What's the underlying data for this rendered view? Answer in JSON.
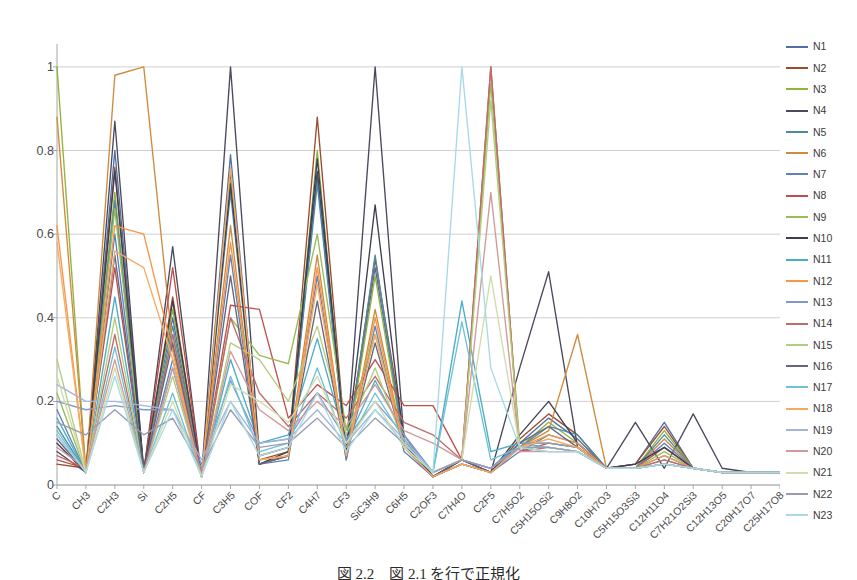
{
  "caption": "図 2.2　図 2.1 を行で正規化",
  "colors": {
    "gridline": "#d0d0d0",
    "axis": "#a6a6a6",
    "text": "#4a4a4a",
    "background": "#ffffff"
  },
  "legend": {
    "position": "right",
    "entries": [
      {
        "label": "N1",
        "color": "#4f6fa5"
      },
      {
        "label": "N2",
        "color": "#9c4d2f"
      },
      {
        "label": "N3",
        "color": "#93b23e"
      },
      {
        "label": "N4",
        "color": "#4a4a5e"
      },
      {
        "label": "N5",
        "color": "#4e89a8"
      },
      {
        "label": "N6",
        "color": "#d08a3e"
      },
      {
        "label": "N7",
        "color": "#5f81bd"
      },
      {
        "label": "N8",
        "color": "#c0504d"
      },
      {
        "label": "N9",
        "color": "#9bbb59"
      },
      {
        "label": "N10",
        "color": "#3f3f54"
      },
      {
        "label": "N11",
        "color": "#4bacc6"
      },
      {
        "label": "N12",
        "color": "#f79646"
      },
      {
        "label": "N13",
        "color": "#8098cf"
      },
      {
        "label": "N14",
        "color": "#bf6d6b"
      },
      {
        "label": "N15",
        "color": "#b5cc7e"
      },
      {
        "label": "N16",
        "color": "#666680"
      },
      {
        "label": "N17",
        "color": "#6fc2d5"
      },
      {
        "label": "N18",
        "color": "#f5ab63"
      },
      {
        "label": "N19",
        "color": "#a4b4dd"
      },
      {
        "label": "N20",
        "color": "#d19a98"
      },
      {
        "label": "N21",
        "color": "#cfdcab"
      },
      {
        "label": "N22",
        "color": "#9a9ab0"
      },
      {
        "label": "N23",
        "color": "#a8dae6"
      }
    ]
  },
  "chart_data": {
    "type": "line",
    "title": "",
    "xlabel": "",
    "ylabel": "",
    "ylim": [
      0,
      1.05
    ],
    "yticks": [
      0,
      0.2,
      0.4,
      0.6,
      0.8,
      1
    ],
    "ytick_labels": [
      "0",
      "0.2",
      "0.4",
      "0.6",
      "0.8",
      "1"
    ],
    "grid": true,
    "grid_axis": "y",
    "legend_position": "right",
    "categories": [
      "C",
      "CH3",
      "C2H3",
      "Si",
      "C2H5",
      "CF",
      "C3H5",
      "COF",
      "CF2",
      "C4H7",
      "CF3",
      "SiC3H9",
      "C6H5",
      "C2OF3",
      "C7H4O",
      "C2F5",
      "C7H5O2",
      "C5H15OSi2",
      "C9H8O2",
      "C10H7O3",
      "C5H15O3Si3",
      "C12H11O4",
      "C7H21O2Si3",
      "C12H13O5",
      "C20H17O7",
      "C25H17O8"
    ],
    "series": [
      {
        "name": "N1",
        "color": "#4f6fa5",
        "values": [
          0.12,
          0.03,
          0.8,
          0.04,
          0.4,
          0.02,
          0.79,
          0.05,
          0.07,
          0.74,
          0.07,
          0.52,
          0.1,
          0.02,
          0.06,
          0.04,
          0.1,
          0.16,
          0.11,
          0.04,
          0.05,
          0.15,
          0.04,
          0.03,
          0.03,
          0.03
        ]
      },
      {
        "name": "N2",
        "color": "#9c4d2f",
        "values": [
          0.05,
          0.04,
          0.76,
          0.03,
          0.45,
          0.02,
          0.75,
          0.06,
          0.08,
          0.88,
          0.08,
          0.54,
          0.12,
          0.02,
          0.05,
          0.03,
          0.11,
          0.17,
          0.12,
          0.04,
          0.05,
          0.14,
          0.04,
          0.03,
          0.03,
          0.03
        ]
      },
      {
        "name": "N3",
        "color": "#93b23e",
        "values": [
          1.0,
          0.03,
          0.7,
          0.03,
          0.42,
          0.02,
          0.73,
          0.05,
          0.07,
          0.8,
          0.07,
          0.5,
          0.09,
          0.02,
          0.05,
          0.03,
          0.09,
          0.15,
          0.1,
          0.04,
          0.04,
          0.13,
          0.04,
          0.03,
          0.03,
          0.03
        ]
      },
      {
        "name": "N4",
        "color": "#4a4a5e",
        "values": [
          0.08,
          0.03,
          0.87,
          0.03,
          0.57,
          0.02,
          1.0,
          0.07,
          0.09,
          0.75,
          0.08,
          1.0,
          0.11,
          0.02,
          0.06,
          0.03,
          0.28,
          0.51,
          0.09,
          0.04,
          0.15,
          0.04,
          0.17,
          0.04,
          0.03,
          0.03
        ]
      },
      {
        "name": "N5",
        "color": "#4e89a8",
        "values": [
          0.14,
          0.03,
          0.68,
          0.03,
          0.38,
          0.02,
          0.7,
          0.05,
          0.07,
          0.72,
          0.07,
          0.55,
          0.09,
          0.02,
          0.05,
          0.03,
          0.09,
          0.14,
          0.12,
          0.04,
          0.04,
          0.12,
          0.04,
          0.03,
          0.03,
          0.03
        ]
      },
      {
        "name": "N6",
        "color": "#d08a3e",
        "values": [
          0.88,
          0.03,
          0.98,
          1.0,
          0.33,
          0.02,
          0.62,
          0.05,
          0.07,
          0.55,
          0.06,
          0.42,
          0.09,
          0.02,
          0.05,
          0.03,
          0.09,
          0.13,
          0.36,
          0.04,
          0.04,
          0.11,
          0.04,
          0.03,
          0.03,
          0.03
        ]
      },
      {
        "name": "N7",
        "color": "#5f81bd",
        "values": [
          0.18,
          0.03,
          0.6,
          0.03,
          0.3,
          0.02,
          0.55,
          0.05,
          0.06,
          0.5,
          0.06,
          0.38,
          0.08,
          0.02,
          0.05,
          0.03,
          0.08,
          0.12,
          0.1,
          0.04,
          0.04,
          0.1,
          0.04,
          0.03,
          0.03,
          0.03
        ]
      },
      {
        "name": "N8",
        "color": "#c0504d",
        "values": [
          0.06,
          0.04,
          0.52,
          0.03,
          0.52,
          0.02,
          0.43,
          0.42,
          0.16,
          0.24,
          0.19,
          0.3,
          0.19,
          0.19,
          0.06,
          1.0,
          0.08,
          0.1,
          0.09,
          0.04,
          0.04,
          0.09,
          0.04,
          0.03,
          0.03,
          0.03
        ]
      },
      {
        "name": "N9",
        "color": "#9bbb59",
        "values": [
          0.22,
          0.03,
          0.66,
          0.03,
          0.36,
          0.02,
          0.4,
          0.31,
          0.29,
          0.6,
          0.13,
          0.36,
          0.1,
          0.03,
          0.06,
          0.96,
          0.1,
          0.1,
          0.09,
          0.04,
          0.04,
          0.08,
          0.04,
          0.03,
          0.03,
          0.03
        ]
      },
      {
        "name": "N10",
        "color": "#3f3f54",
        "values": [
          0.1,
          0.03,
          0.75,
          0.03,
          0.44,
          0.02,
          0.72,
          0.05,
          0.08,
          0.78,
          0.08,
          0.67,
          0.1,
          0.02,
          0.06,
          0.03,
          0.12,
          0.2,
          0.1,
          0.04,
          0.05,
          0.09,
          0.04,
          0.03,
          0.03,
          0.03
        ]
      },
      {
        "name": "N11",
        "color": "#4bacc6",
        "values": [
          0.16,
          0.03,
          0.45,
          0.03,
          0.28,
          0.02,
          0.3,
          0.1,
          0.12,
          0.35,
          0.1,
          0.25,
          0.12,
          0.03,
          0.44,
          0.08,
          0.1,
          0.09,
          0.08,
          0.04,
          0.04,
          0.07,
          0.04,
          0.03,
          0.03,
          0.03
        ]
      },
      {
        "name": "N12",
        "color": "#f79646",
        "values": [
          0.62,
          0.03,
          0.62,
          0.6,
          0.32,
          0.02,
          0.58,
          0.06,
          0.07,
          0.52,
          0.07,
          0.4,
          0.09,
          0.02,
          0.05,
          0.03,
          0.09,
          0.12,
          0.1,
          0.04,
          0.04,
          0.07,
          0.04,
          0.03,
          0.03,
          0.03
        ]
      },
      {
        "name": "N13",
        "color": "#8098cf",
        "values": [
          0.2,
          0.18,
          0.19,
          0.18,
          0.18,
          0.05,
          0.25,
          0.1,
          0.11,
          0.22,
          0.11,
          0.2,
          0.12,
          0.03,
          0.06,
          0.04,
          0.1,
          0.1,
          0.09,
          0.04,
          0.04,
          0.06,
          0.04,
          0.03,
          0.03,
          0.03
        ]
      },
      {
        "name": "N14",
        "color": "#bf6d6b",
        "values": [
          0.07,
          0.04,
          0.36,
          0.03,
          0.36,
          0.02,
          0.4,
          0.22,
          0.14,
          0.22,
          0.16,
          0.26,
          0.15,
          0.12,
          0.06,
          1.0,
          0.08,
          0.09,
          0.08,
          0.04,
          0.04,
          0.06,
          0.04,
          0.03,
          0.03,
          0.03
        ]
      },
      {
        "name": "N15",
        "color": "#b5cc7e",
        "values": [
          0.3,
          0.03,
          0.4,
          0.03,
          0.26,
          0.02,
          0.34,
          0.3,
          0.2,
          0.38,
          0.12,
          0.28,
          0.1,
          0.03,
          0.06,
          0.92,
          0.09,
          0.09,
          0.08,
          0.04,
          0.04,
          0.05,
          0.04,
          0.03,
          0.03,
          0.03
        ]
      },
      {
        "name": "N16",
        "color": "#666680",
        "values": [
          0.11,
          0.03,
          0.55,
          0.03,
          0.34,
          0.02,
          0.5,
          0.05,
          0.07,
          0.44,
          0.07,
          0.34,
          0.09,
          0.02,
          0.06,
          0.03,
          0.1,
          0.14,
          0.09,
          0.04,
          0.04,
          0.05,
          0.04,
          0.03,
          0.03,
          0.03
        ]
      },
      {
        "name": "N17",
        "color": "#6fc2d5",
        "values": [
          0.13,
          0.03,
          0.33,
          0.03,
          0.22,
          0.02,
          0.26,
          0.08,
          0.1,
          0.28,
          0.09,
          0.22,
          0.11,
          0.03,
          0.39,
          0.06,
          0.09,
          0.08,
          0.08,
          0.04,
          0.04,
          0.05,
          0.04,
          0.03,
          0.03,
          0.03
        ]
      },
      {
        "name": "N18",
        "color": "#f5ab63",
        "values": [
          0.58,
          0.03,
          0.56,
          0.52,
          0.3,
          0.02,
          0.76,
          0.06,
          0.07,
          0.48,
          0.07,
          0.36,
          0.09,
          0.02,
          0.05,
          0.03,
          0.09,
          0.11,
          0.09,
          0.04,
          0.04,
          0.05,
          0.04,
          0.03,
          0.03,
          0.03
        ]
      },
      {
        "name": "N19",
        "color": "#a4b4dd",
        "values": [
          0.24,
          0.2,
          0.2,
          0.19,
          0.18,
          0.06,
          0.2,
          0.1,
          0.11,
          0.18,
          0.1,
          0.18,
          0.11,
          0.03,
          0.06,
          0.04,
          0.09,
          0.09,
          0.08,
          0.04,
          0.04,
          0.05,
          0.04,
          0.03,
          0.03,
          0.03
        ]
      },
      {
        "name": "N20",
        "color": "#d19a98",
        "values": [
          0.09,
          0.04,
          0.3,
          0.03,
          0.28,
          0.02,
          0.32,
          0.18,
          0.13,
          0.2,
          0.14,
          0.24,
          0.13,
          0.1,
          0.06,
          0.7,
          0.08,
          0.08,
          0.08,
          0.04,
          0.04,
          0.05,
          0.04,
          0.03,
          0.03,
          0.03
        ]
      },
      {
        "name": "N21",
        "color": "#cfdcab",
        "values": [
          0.26,
          0.03,
          0.28,
          0.03,
          0.2,
          0.02,
          0.24,
          0.2,
          0.15,
          0.26,
          0.1,
          0.2,
          0.09,
          0.03,
          0.06,
          0.5,
          0.09,
          0.09,
          0.08,
          0.04,
          0.04,
          0.05,
          0.04,
          0.03,
          0.03,
          0.03
        ]
      },
      {
        "name": "N22",
        "color": "#9a9ab0",
        "values": [
          0.15,
          0.12,
          0.18,
          0.12,
          0.16,
          0.04,
          0.18,
          0.09,
          0.1,
          0.16,
          0.09,
          0.16,
          0.1,
          0.03,
          0.06,
          0.04,
          0.09,
          0.09,
          0.08,
          0.04,
          0.04,
          0.05,
          0.04,
          0.03,
          0.03,
          0.03
        ]
      },
      {
        "name": "N23",
        "color": "#a8dae6",
        "values": [
          0.12,
          0.03,
          0.26,
          0.03,
          0.18,
          0.02,
          0.2,
          0.07,
          0.09,
          0.22,
          0.08,
          0.18,
          0.1,
          0.03,
          1.0,
          0.28,
          0.09,
          0.08,
          0.08,
          0.04,
          0.04,
          0.05,
          0.04,
          0.03,
          0.03,
          0.03
        ]
      }
    ]
  }
}
